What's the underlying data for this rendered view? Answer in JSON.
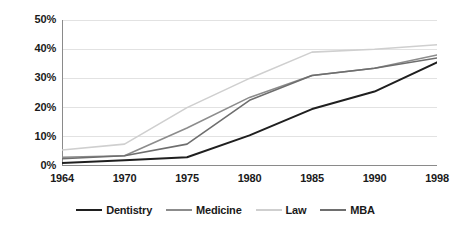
{
  "chart_data": {
    "type": "line",
    "title": "",
    "xlabel": "",
    "ylabel": "",
    "categories": [
      "1964",
      "1970",
      "1975",
      "1980",
      "1985",
      "1990",
      "1998"
    ],
    "ylim": [
      0,
      50
    ],
    "yticks": [
      0,
      10,
      20,
      30,
      40,
      50
    ],
    "ytick_labels": [
      "0%",
      "10%",
      "20%",
      "30%",
      "40%",
      "50%"
    ],
    "grid": true,
    "legend_position": "bottom",
    "series": [
      {
        "name": "Dentistry",
        "color": "#1f1f1f",
        "width": 2.0,
        "values": [
          1.0,
          2.0,
          3.0,
          10.5,
          19.5,
          25.5,
          35.5
        ]
      },
      {
        "name": "Medicine",
        "color": "#8c8c8c",
        "width": 1.6,
        "values": [
          3.0,
          3.5,
          13.0,
          23.5,
          31.0,
          33.5,
          38.0
        ]
      },
      {
        "name": "Law",
        "color": "#cfcfcf",
        "width": 1.6,
        "values": [
          5.5,
          7.5,
          20.0,
          30.0,
          39.0,
          40.0,
          41.5
        ]
      },
      {
        "name": "MBA",
        "color": "#6e6e6e",
        "width": 1.6,
        "values": [
          2.5,
          3.5,
          7.5,
          22.5,
          31.0,
          33.5,
          37.0
        ]
      }
    ],
    "axis_color": "#8a8a8a",
    "grid_color": "#e2e2e2",
    "background": "#ffffff"
  }
}
